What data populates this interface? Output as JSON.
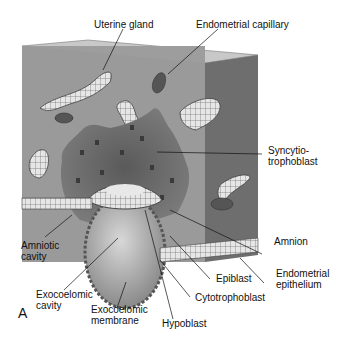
{
  "figure": {
    "panel_letter": "A",
    "labels": {
      "uterine_gland": "Uterine gland",
      "endometrial_capillary": "Endometrial capillary",
      "syncytiotrophoblast": "Syncytio-\ntrophoblast",
      "amnion": "Amnion",
      "endometrial_epithelium": "Endometrial\nepithelium",
      "epiblast": "Epiblast",
      "cytotrophoblast": "Cytotrophoblast",
      "hypoblast": "Hypoblast",
      "exocoelomic_membrane": "Exocoelomic\nmembrane",
      "exocoelomic_cavity": "Exocoelomic\ncavity",
      "amniotic_cavity": "Amniotic\ncavity"
    }
  }
}
